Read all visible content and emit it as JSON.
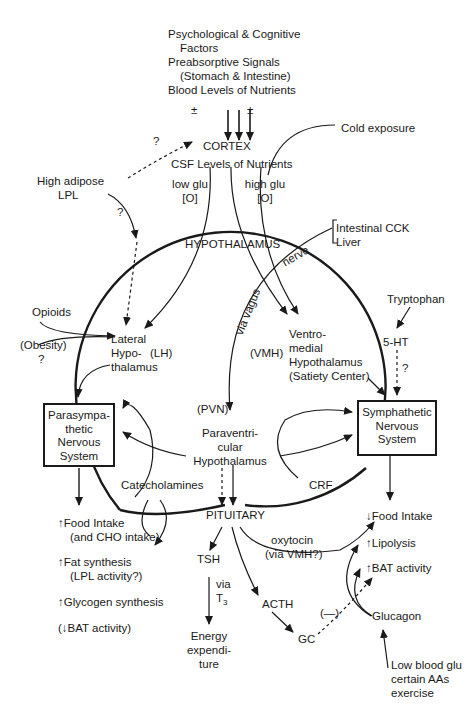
{
  "diagram": {
    "inputs_top": {
      "line1": "Psychological & Cognitive",
      "line2": "Factors",
      "line3": "Preabsorptive Signals",
      "line4": "(Stomach & Intestine)",
      "line5": "Blood Levels of Nutrients",
      "plus_minus_left": "±",
      "plus_minus_right": "±"
    },
    "cortex": "CORTEX",
    "csf_levels": "CSF Levels of Nutrients",
    "cold_exposure": "Cold exposure",
    "low_glu": {
      "line1": "low glu",
      "line2": "[O]"
    },
    "high_glu": {
      "line1": "high glu",
      "line2": "[O]"
    },
    "high_adipose": {
      "line1": "High adipose",
      "line2": "LPL"
    },
    "question_cortex": "?",
    "question_adipose": "?",
    "hypothalamus": "HYPOTHALAMUS",
    "nerve": "nerve",
    "via_vagus": "via vagus",
    "intestinal": {
      "line1": "Intestinal CCK",
      "line2": "Liver"
    },
    "opioids": "Opioids",
    "obesity": {
      "line1": "(Obesity)",
      "line2": "?"
    },
    "lateral_hypothalamus": {
      "line1": "Lateral",
      "line2": "Hypo-",
      "line3": "thalamus",
      "abbr": "(LH)"
    },
    "vmh_abbr": "(VMH)",
    "ventromedial": {
      "line1": "Ventro-",
      "line2": "medial",
      "line3": "Hypothalamus",
      "line4": "(Satiety Center)"
    },
    "tryptophan": "Tryptophan",
    "five_ht": "5-HT",
    "question_5ht": "?",
    "pvn_abbr": "(PVN)",
    "paraventricular": {
      "line1": "Paraventri-",
      "line2": "cular",
      "line3": "Hypothalamus"
    },
    "parasympathetic_box": {
      "line1": "Parasympa-",
      "line2": "thetic",
      "line3": "Nervous",
      "line4": "System"
    },
    "sympathetic_box": {
      "line1": "Symphathetic",
      "line2": "Nervous",
      "line3": "System"
    },
    "catecholamines": "Catecholamines",
    "crf": "CRF",
    "pituitary": "PITUITARY",
    "left_effects": {
      "food_intake": "↑Food Intake",
      "cho_intake": "(and CHO intake)",
      "fat_synthesis": "↑Fat synthesis",
      "lpl_activity": "(LPL activity?)",
      "glycogen": "↑Glycogen synthesis",
      "bat": "(↓BAT activity)"
    },
    "tsh": "TSH",
    "via_t3": {
      "via": "via",
      "t": "T",
      "sub": "3"
    },
    "energy": {
      "line1": "Energy",
      "line2": "expendi-",
      "line3": "ture"
    },
    "oxytocin": {
      "line1": "oxytocin",
      "line2": "(via VMH?)"
    },
    "acth": "ACTH",
    "gc": "GC",
    "minus": "(—)",
    "right_effects": {
      "food_intake": "↓Food Intake",
      "lipolysis": "↑Lipolysis",
      "bat": "↑BAT activity"
    },
    "glucagon": "Glucagon",
    "glucagon_inputs": {
      "line1": "Low blood glu",
      "line2": "certain AAs",
      "line3": "exercise"
    }
  },
  "colors": {
    "ink": "#1a1a1a",
    "background": "#ffffff"
  }
}
